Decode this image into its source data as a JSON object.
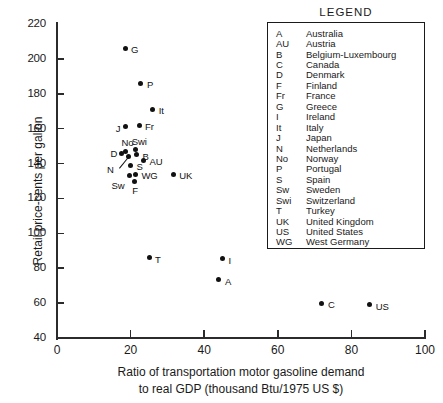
{
  "chart_data": {
    "type": "scatter",
    "title": "",
    "xlabel": "Ratio of transportation motor gasoline demand to real GDP  (thousand Btu/1975 US $)",
    "xlabel_line1": "Ratio of transportation motor gasoline demand",
    "xlabel_line2": "to real GDP  (thousand Btu/1975 US $)",
    "ylabel": "Retail price-cents per gallon",
    "xlim": [
      0,
      100
    ],
    "ylim": [
      40,
      220
    ],
    "xticks": [
      0,
      20,
      40,
      60,
      80,
      100
    ],
    "yticks": [
      40,
      60,
      80,
      100,
      120,
      140,
      160,
      180,
      200,
      220
    ],
    "grid": false,
    "legend_position": "upper-right-inset",
    "points": [
      {
        "code": "G",
        "country": "Greece",
        "x": 18.5,
        "y": 206,
        "lx": 6,
        "ly": -4
      },
      {
        "code": "P",
        "country": "Portugal",
        "x": 22.8,
        "y": 186,
        "lx": 6,
        "ly": -4
      },
      {
        "code": "It",
        "country": "Italy",
        "x": 26.0,
        "y": 171,
        "lx": 6,
        "ly": -4
      },
      {
        "code": "Fr",
        "country": "France",
        "x": 22.3,
        "y": 162,
        "lx": 6,
        "ly": -4
      },
      {
        "code": "J",
        "country": "Japan",
        "x": 18.7,
        "y": 161,
        "lx": -10,
        "ly": -4
      },
      {
        "code": "No",
        "country": "Norway",
        "x": 18.6,
        "y": 147,
        "lx": -4,
        "ly": -14
      },
      {
        "code": "Swi",
        "country": "Switzerland",
        "x": 21.4,
        "y": 148,
        "lx": -4,
        "ly": -14
      },
      {
        "code": "D",
        "country": "Denmark",
        "x": 17.5,
        "y": 146,
        "lx": -11,
        "ly": -5
      },
      {
        "code": "B",
        "country": "Belgium-Luxembourg",
        "x": 21.6,
        "y": 145,
        "lx": 6,
        "ly": -4
      },
      {
        "code": "AU",
        "country": "Austria",
        "x": 23.5,
        "y": 142,
        "lx": 6,
        "ly": -4
      },
      {
        "code": "N",
        "country": "Netherlands",
        "x": 19.3,
        "y": 144,
        "lx": -21,
        "ly": 7
      },
      {
        "code": "S",
        "country": "Spain",
        "x": 20.0,
        "y": 139,
        "lx": 6,
        "ly": -4
      },
      {
        "code": "WG",
        "country": "West Germany",
        "x": 21.3,
        "y": 134,
        "lx": 6,
        "ly": -4
      },
      {
        "code": "Sw",
        "country": "Sweden",
        "x": 19.7,
        "y": 133,
        "lx": -18,
        "ly": 4
      },
      {
        "code": "F",
        "country": "Finland",
        "x": 21.0,
        "y": 130,
        "lx": -2,
        "ly": 4
      },
      {
        "code": "UK",
        "country": "United Kingdom",
        "x": 31.6,
        "y": 134,
        "lx": 6,
        "ly": -4
      },
      {
        "code": "T",
        "country": "Turkey",
        "x": 25.0,
        "y": 86,
        "lx": 6,
        "ly": -4
      },
      {
        "code": "I",
        "country": "Ireland",
        "x": 45.0,
        "y": 85.5,
        "lx": 6,
        "ly": -4
      },
      {
        "code": "A",
        "country": "Australia",
        "x": 44.0,
        "y": 73.5,
        "lx": 6,
        "ly": -4
      },
      {
        "code": "C",
        "country": "Canada",
        "x": 72.0,
        "y": 60,
        "lx": 6,
        "ly": -4
      },
      {
        "code": "US",
        "country": "United States",
        "x": 85.0,
        "y": 59,
        "lx": 6,
        "ly": -4
      }
    ]
  },
  "legend": {
    "title": "LEGEND",
    "entries": [
      {
        "code": "A",
        "name": "Australia"
      },
      {
        "code": "AU",
        "name": "Austria"
      },
      {
        "code": "B",
        "name": "Belgium-Luxembourg"
      },
      {
        "code": "C",
        "name": "Canada"
      },
      {
        "code": "D",
        "name": "Denmark"
      },
      {
        "code": "F",
        "name": "Finland"
      },
      {
        "code": "Fr",
        "name": "France"
      },
      {
        "code": "G",
        "name": "Greece"
      },
      {
        "code": "I",
        "name": "Ireland"
      },
      {
        "code": "It",
        "name": "Italy"
      },
      {
        "code": "J",
        "name": "Japan"
      },
      {
        "code": "N",
        "name": "Netherlands"
      },
      {
        "code": "No",
        "name": "Norway"
      },
      {
        "code": "P",
        "name": "Portugal"
      },
      {
        "code": "S",
        "name": "Spain"
      },
      {
        "code": "Sw",
        "name": "Sweden"
      },
      {
        "code": "Swi",
        "name": "Switzerland"
      },
      {
        "code": "T",
        "name": "Turkey"
      },
      {
        "code": "UK",
        "name": "United Kingdom"
      },
      {
        "code": "US",
        "name": "United States"
      },
      {
        "code": "WG",
        "name": "West Germany"
      }
    ]
  },
  "colors": {
    "ink": "#1a1a1a",
    "point": "#111111",
    "axis": "#2b2b2b",
    "background": "#ffffff"
  }
}
